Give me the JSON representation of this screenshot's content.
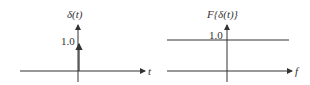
{
  "left_plot": {
    "y_label": "δ(t)",
    "x_label": "t",
    "value_label": "1.0"
  },
  "right_plot": {
    "y_label": "F{δ(t)}",
    "x_label": "f",
    "value_label": "1.0"
  },
  "colors": {
    "line": "#333333",
    "background": "#ffffff"
  }
}
